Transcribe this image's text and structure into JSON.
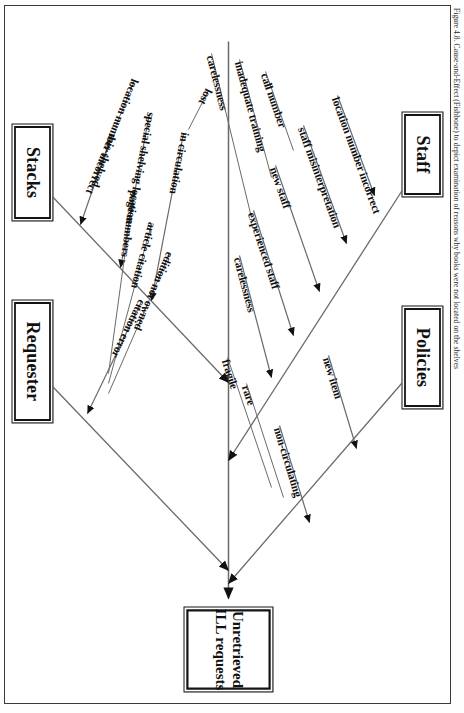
{
  "figure": {
    "caption": "Figure 4.8. Cause-and-Effect (Fishbone) to depict examination of reasons why books were not located on the shelves",
    "type": "cause-and-effect-fishbone",
    "orientation": "rotated-90-clockwise"
  },
  "diagram": {
    "effect": {
      "line1": "Unretrieved",
      "line2": "ILL requests"
    },
    "categories": [
      {
        "id": "stacks",
        "label": "Stacks",
        "side": "upper-left",
        "causes": [
          {
            "label": "mis-shelved",
            "subcauses": [
              {
                "label": "location number incorrect"
              }
            ]
          },
          {
            "label": "special shelving location",
            "subcauses": []
          },
          {
            "label": "in circulation",
            "subcauses": [
              {
                "label": "lost"
              }
            ]
          }
        ]
      },
      {
        "id": "requester",
        "label": "Requester",
        "side": "upper-right",
        "causes": [
          {
            "label": "citation error",
            "subcauses": [
              {
                "label": "edition not owned"
              },
              {
                "label": "article citation"
              },
              {
                "label": "page numbers"
              }
            ]
          }
        ]
      },
      {
        "id": "staff",
        "label": "Staff",
        "side": "lower-left",
        "causes": [
          {
            "label": "location number incorrect",
            "subcauses": []
          },
          {
            "label": "staff misinterpretation",
            "subcauses": [
              {
                "label": "call number"
              }
            ]
          },
          {
            "label": "new staff",
            "subcauses": [
              {
                "label": "inadequate training"
              }
            ]
          },
          {
            "label": "experienced staff",
            "subcauses": [
              {
                "label": "carelessness"
              }
            ]
          },
          {
            "label": "carelessness",
            "subcauses": []
          }
        ]
      },
      {
        "id": "policies",
        "label": "Policies",
        "side": "lower-right",
        "causes": [
          {
            "label": "new item",
            "subcauses": []
          },
          {
            "label": "non-circulating",
            "subcauses": [
              {
                "label": "rare"
              },
              {
                "label": "fragile"
              }
            ]
          }
        ]
      }
    ]
  },
  "colors": {
    "ink": "#111111",
    "line": "#5a5a5a",
    "frame": "#3a3a3a",
    "paper": "#ffffff"
  }
}
